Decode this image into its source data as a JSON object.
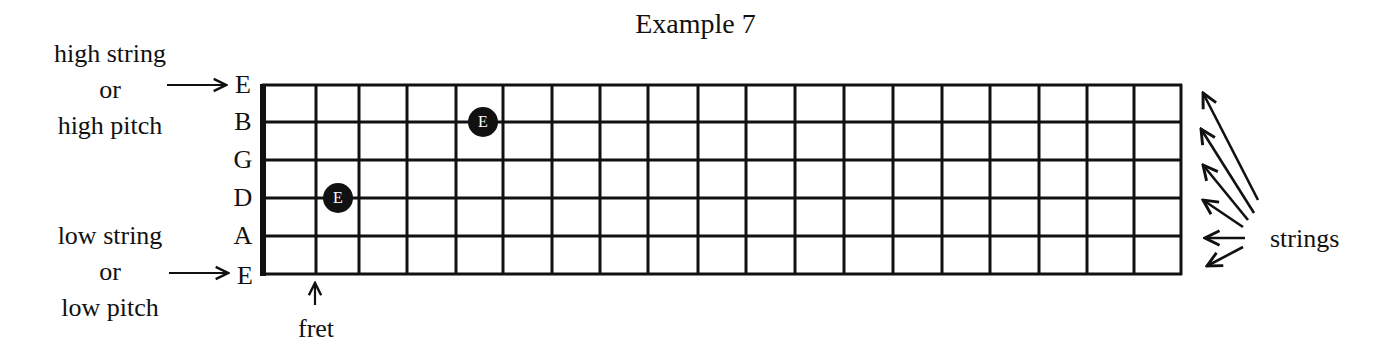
{
  "title": "Example 7",
  "labels": {
    "high": [
      "high string",
      "or",
      "high pitch"
    ],
    "low": [
      "low string",
      "or",
      "low pitch"
    ],
    "fret": "fret",
    "strings": "strings"
  },
  "fretboard": {
    "string_names": [
      "E",
      "B",
      "G",
      "D",
      "A",
      "E"
    ],
    "num_frets": 19,
    "notes": [
      {
        "string": "D",
        "string_index": 3,
        "fret": 2,
        "label": "E"
      },
      {
        "string": "B",
        "string_index": 1,
        "fret": 5,
        "label": "E"
      }
    ]
  }
}
